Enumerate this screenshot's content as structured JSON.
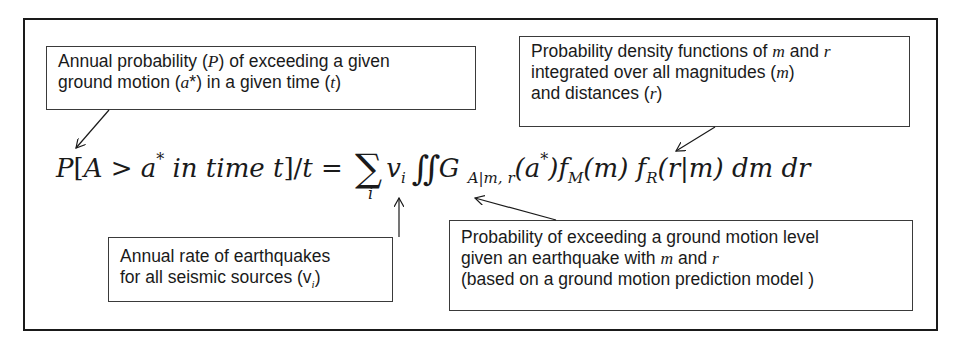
{
  "diagram": {
    "formula": {
      "lhs_P": "P",
      "lhs_bracket_open": "[A > a",
      "lhs_star": "*",
      "lhs_rest": " in time t]/t = ",
      "sum_symbol": "∑",
      "sum_index": "i",
      "nu": "v",
      "nu_sub": "i",
      "integral": "∬",
      "G": "G",
      "G_sub": "A|m, r",
      "G_arg_open": "(a",
      "G_arg_star": "*",
      "G_arg_close": ")",
      "fM": "f",
      "fM_sub": "M",
      "fM_arg": "(m) ",
      "fR": "f",
      "fR_sub": "R",
      "fR_arg": "(r|m) dm dr"
    },
    "annotations": {
      "annual_probability": {
        "lines": [
          "Annual probability (P) of exceeding a given",
          "ground motion (a*) in a given time (t)"
        ]
      },
      "pdf": {
        "lines": [
          "Probability density functions of m and r",
          "integrated over all magnitudes (m)",
          "and distances (r)"
        ]
      },
      "annual_rate": {
        "lines": [
          "Annual rate of earthquakes",
          "for all seismic sources (v",
          "i",
          ")"
        ]
      },
      "exceedance": {
        "lines": [
          "Probability of exceeding a ground motion level",
          "given an earthquake with m and r",
          "(based on a ground motion prediction model )"
        ]
      }
    },
    "colors": {
      "stroke": "#1a1a1a",
      "background": "#ffffff"
    }
  }
}
